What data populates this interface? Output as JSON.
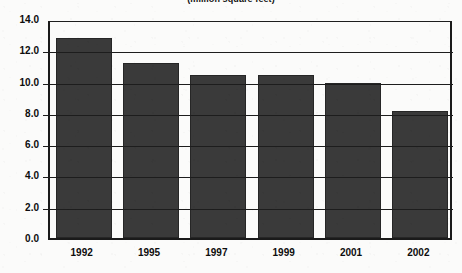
{
  "chart_data": {
    "type": "bar",
    "title": "(million square feet)",
    "xlabel": "",
    "ylabel": "",
    "categories": [
      "1992",
      "1995",
      "1997",
      "1999",
      "2001",
      "2002"
    ],
    "values": [
      12.8,
      11.2,
      10.4,
      10.4,
      9.9,
      8.1
    ],
    "ylim": [
      0.0,
      14.0
    ],
    "ytick_step": 2.0,
    "ytick_labels": [
      "0.0",
      "2.0",
      "4.0",
      "6.0",
      "8.0",
      "10.0",
      "12.0",
      "14.0"
    ],
    "ytick_values": [
      0.0,
      2.0,
      4.0,
      6.0,
      8.0,
      10.0,
      12.0,
      14.0
    ],
    "grid": true,
    "grid_axis": "y",
    "legend": null,
    "legend_position": "none",
    "bar_color": "#3a3a3a",
    "axis_color": "#1a1a1a",
    "background_color": "#fbfbfa",
    "text_color": "#0d0d0d",
    "series": [
      {
        "name": "floor space",
        "values": [
          12.8,
          11.2,
          10.4,
          10.4,
          9.9,
          8.1
        ]
      }
    ]
  }
}
